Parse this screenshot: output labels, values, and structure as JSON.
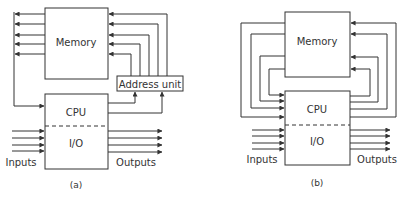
{
  "diagram_a": {
    "memory_label": "Memory",
    "address_unit_label": "Address unit",
    "cpu_label": "CPU",
    "io_label": "I/O",
    "inputs_label": "Inputs",
    "outputs_label": "Outputs",
    "caption": "(a)"
  },
  "diagram_b": {
    "memory_label": "Memory",
    "cpu_label": "CPU",
    "io_label": "I/O",
    "inputs_label": "Inputs",
    "outputs_label": "Outputs",
    "caption": "(b)"
  },
  "colors": {
    "stroke": "#333333",
    "text": "#333333",
    "background": "#ffffff"
  }
}
